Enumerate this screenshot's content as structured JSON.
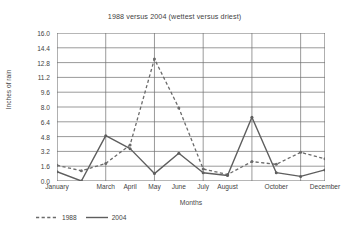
{
  "chart_data": {
    "type": "line",
    "title": "1988 versus 2004 (wettest versus driest)",
    "xlabel": "Months",
    "ylabel": "Inches of rain",
    "ylim": [
      0.0,
      16.0
    ],
    "ytick_step": 1.6,
    "yticks": [
      "16.0",
      "14.4",
      "12.8",
      "11.2",
      "9.6",
      "8.0",
      "6.4",
      "4.8",
      "3.2",
      "1.6",
      "0.0"
    ],
    "ytick_values": [
      16.0,
      14.4,
      12.8,
      11.2,
      9.6,
      8.0,
      6.4,
      4.8,
      3.2,
      1.6,
      0.0
    ],
    "categories": [
      "January",
      "February",
      "March",
      "April",
      "May",
      "June",
      "July",
      "August",
      "September",
      "October",
      "November",
      "December"
    ],
    "xtick_labels_shown": [
      "January",
      "March",
      "April",
      "May",
      "June",
      "July",
      "August",
      "October",
      "December"
    ],
    "grid": true,
    "legend_position": "bottom-left",
    "series": [
      {
        "name": "1988",
        "style": "dashed",
        "color": "#6b6b6b",
        "values": [
          1.7,
          1.1,
          1.9,
          3.9,
          13.2,
          7.9,
          1.3,
          0.7,
          2.1,
          1.8,
          3.1,
          2.4
        ]
      },
      {
        "name": "2004",
        "style": "solid",
        "color": "#5e5e5e",
        "values": [
          1.0,
          0.0,
          4.9,
          3.5,
          0.8,
          3.0,
          0.9,
          0.6,
          6.9,
          0.9,
          0.5,
          1.2
        ]
      }
    ]
  },
  "legend": {
    "items": [
      {
        "label": "1988"
      },
      {
        "label": "2004"
      }
    ]
  }
}
